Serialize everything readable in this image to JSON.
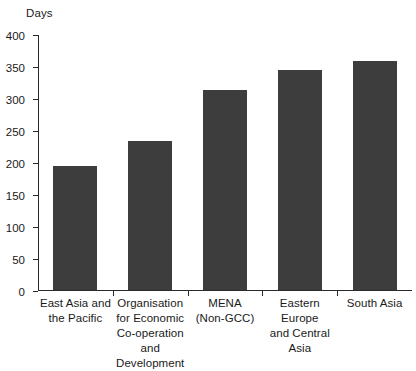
{
  "chart_data": {
    "type": "bar",
    "title": "",
    "subtitle": "",
    "xlabel": "",
    "ylabel": "Days",
    "ylim": [
      0,
      400
    ],
    "yticks": [
      0,
      50,
      100,
      150,
      200,
      250,
      300,
      350,
      400
    ],
    "grid": false,
    "legend": null,
    "bar_color": "#3d3d3d",
    "axis_color": "#2b2b2b",
    "categories": [
      "East Asia and the Pacific",
      "Organisation for Economic Co-operation and Development",
      "MENA (Non-GCC)",
      "Eastern Europe and Central Asia",
      "South Asia"
    ],
    "category_lines": [
      [
        "East Asia and",
        "the Pacific"
      ],
      [
        "Organisation",
        "for Economic",
        "Co-operation",
        "and Development"
      ],
      [
        "MENA",
        "(Non-GCC)"
      ],
      [
        "Eastern Europe",
        "and Central Asia"
      ],
      [
        "South Asia"
      ]
    ],
    "values": [
      194,
      233,
      312,
      344,
      358
    ],
    "series": [
      {
        "name": "Days",
        "values": [
          194,
          233,
          312,
          344,
          358
        ]
      }
    ]
  }
}
